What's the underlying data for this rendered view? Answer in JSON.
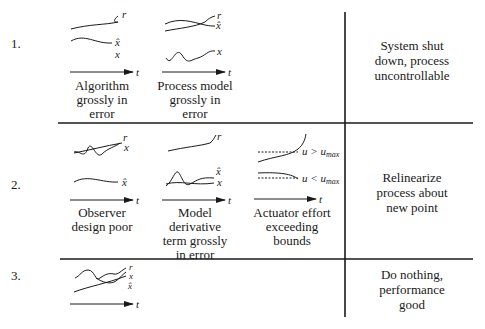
{
  "rows": [
    {
      "number": "1.",
      "cases": [
        {
          "caption_lines": [
            "Algorithm",
            "grossly in",
            "error"
          ],
          "labels": [
            "r",
            "x̂",
            "x"
          ],
          "axis_label": "t"
        },
        {
          "caption_lines": [
            "Process model",
            "grossly in",
            "error"
          ],
          "labels": [
            "r",
            "x̂",
            "x"
          ],
          "axis_label": "t"
        }
      ],
      "action_lines": [
        "System shut",
        "down, process",
        "uncontrollable"
      ]
    },
    {
      "number": "2.",
      "cases": [
        {
          "caption_lines": [
            "Observer",
            "design poor"
          ],
          "labels": [
            "r",
            "x",
            "x̂"
          ],
          "axis_label": "t"
        },
        {
          "caption_lines": [
            "Model",
            "derivative",
            "term grossly",
            "in error"
          ],
          "labels": [
            "r",
            "x̂",
            "x"
          ],
          "axis_label": "t"
        },
        {
          "caption_lines": [
            "Actuator effort",
            "exceeding",
            "bounds"
          ],
          "labels": [
            "u > u_max",
            "u < u_max"
          ],
          "axis_label": "t"
        }
      ],
      "action_lines": [
        "Relinearize",
        "process about",
        "new point"
      ]
    },
    {
      "number": "3.",
      "cases": [
        {
          "caption_lines": [],
          "labels": [
            "r",
            "x",
            "x̂"
          ],
          "axis_label": "t"
        }
      ],
      "action_lines": [
        "Do nothing,",
        "performance",
        "good"
      ]
    }
  ],
  "colors": {
    "ink": "#1a1a1a",
    "background": "#ffffff"
  }
}
